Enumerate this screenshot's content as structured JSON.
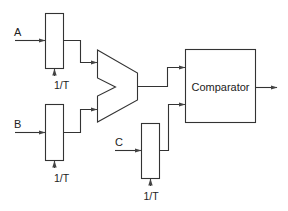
{
  "diagram": {
    "type": "block-diagram",
    "inputs": [
      {
        "id": "A",
        "label": "A"
      },
      {
        "id": "B",
        "label": "B"
      },
      {
        "id": "C",
        "label": "C"
      }
    ],
    "integrators": [
      {
        "id": "int-A",
        "input": "A",
        "control_label": "1/T"
      },
      {
        "id": "int-B",
        "input": "B",
        "control_label": "1/T"
      },
      {
        "id": "int-C",
        "input": "C",
        "control_label": "1/T"
      }
    ],
    "subtractor": {
      "id": "subtractor",
      "inputs": [
        "int-A",
        "int-B"
      ]
    },
    "comparator": {
      "id": "comparator",
      "label": "Comparator",
      "inputs": [
        "subtractor",
        "int-C"
      ]
    },
    "edges": [
      [
        "A",
        "int-A"
      ],
      [
        "B",
        "int-B"
      ],
      [
        "C",
        "int-C"
      ],
      [
        "int-A",
        "subtractor"
      ],
      [
        "int-B",
        "subtractor"
      ],
      [
        "subtractor",
        "comparator"
      ],
      [
        "int-C",
        "comparator"
      ],
      [
        "comparator",
        "output"
      ]
    ]
  },
  "labels": {
    "input_a": "A",
    "input_b": "B",
    "input_c": "C",
    "control_a": "1/T",
    "control_b": "1/T",
    "control_c": "1/T",
    "comparator": "Comparator"
  }
}
